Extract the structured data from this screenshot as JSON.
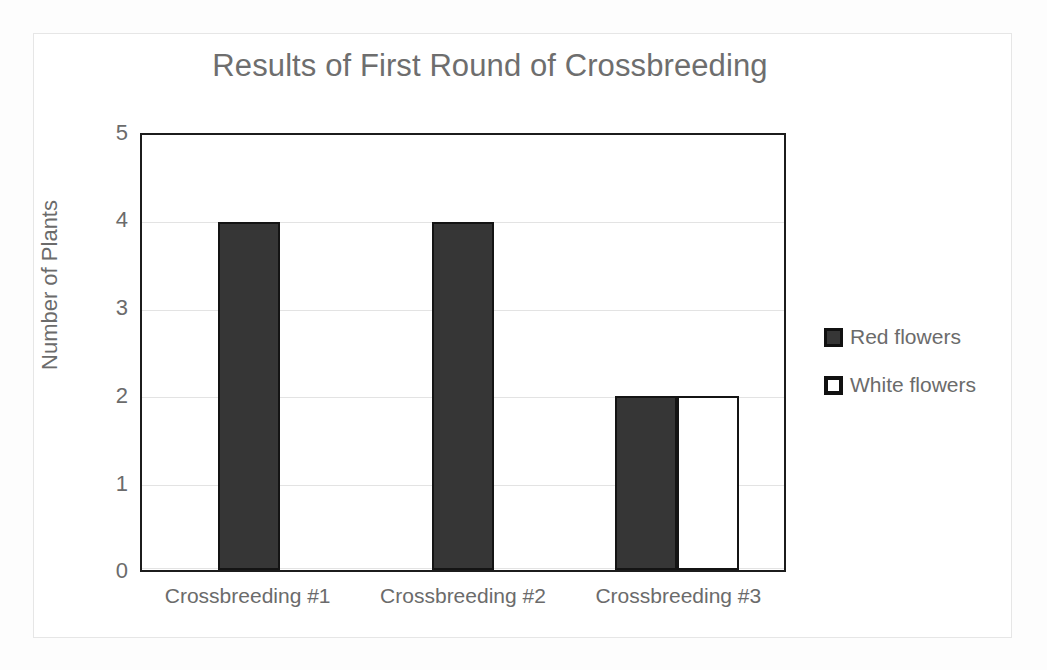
{
  "chart_data": {
    "type": "bar",
    "title": "Results of First Round of Crossbreeding",
    "xlabel": "",
    "ylabel": "Number of Plants",
    "categories": [
      "Crossbreeding #1",
      "Crossbreeding #2",
      "Crossbreeding #3"
    ],
    "series": [
      {
        "name": "Red flowers",
        "values": [
          4,
          4,
          2
        ],
        "color": "#363636"
      },
      {
        "name": "White flowers",
        "values": [
          0,
          0,
          2
        ],
        "color": "#ffffff"
      }
    ],
    "ylim": [
      0,
      5
    ],
    "yticks": [
      "0",
      "1",
      "2",
      "3",
      "4",
      "5"
    ],
    "grid": "horizontal",
    "legend_position": "right"
  },
  "axis": {
    "y_title": "Number of Plants",
    "tick_0": "0",
    "tick_1": "1",
    "tick_2": "2",
    "tick_3": "3",
    "tick_4": "4",
    "tick_5": "5"
  },
  "categories": {
    "c0": "Crossbreeding #1",
    "c1": "Crossbreeding #2",
    "c2": "Crossbreeding #3"
  },
  "legend": {
    "items": [
      {
        "label": "Red flowers",
        "swatch": "filled-dark-square-icon"
      },
      {
        "label": "White flowers",
        "swatch": "outlined-white-square-icon"
      }
    ]
  },
  "colors": {
    "series_red": "#363636",
    "series_white": "#ffffff",
    "outline": "#141414",
    "text": "#6b6b6b",
    "gridline": "#e3e3e3",
    "background": "#fdfdfd"
  }
}
